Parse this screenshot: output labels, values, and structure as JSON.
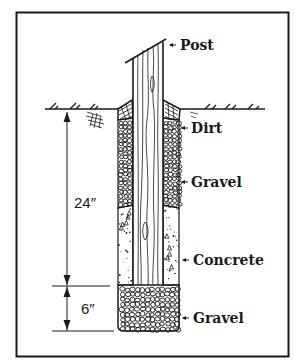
{
  "labels": {
    "post": "Post",
    "dirt": "Dirt",
    "gravel_upper": "Gravel",
    "concrete": "Concrete",
    "gravel_base": "Gravel"
  },
  "dimensions": {
    "upper_depth": "24″",
    "base_depth": "6″"
  },
  "colors": {
    "ink": "#1a1a1a",
    "background": "#ffffff"
  }
}
